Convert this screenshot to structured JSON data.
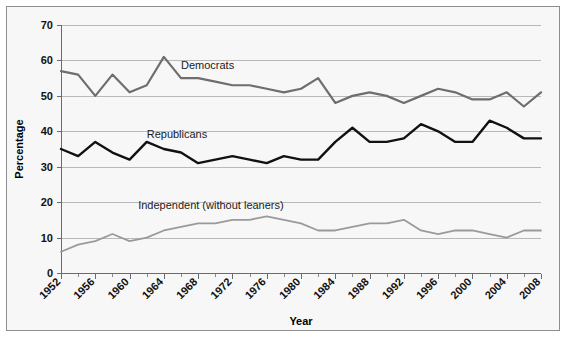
{
  "figure": {
    "background": "#f7f7f7",
    "border_color": "#8d8d8d"
  },
  "chart_data": {
    "type": "line",
    "title": "",
    "xlabel": "Year",
    "ylabel": "Percentage",
    "xlim": [
      1952,
      2008
    ],
    "ylim": [
      0,
      70
    ],
    "yticks": [
      0,
      10,
      20,
      30,
      40,
      50,
      60,
      70
    ],
    "ytick_labels": [
      "0",
      "10",
      "20",
      "30",
      "40",
      "50",
      "60",
      "70"
    ],
    "xticks": [
      1952,
      1956,
      1960,
      1964,
      1968,
      1972,
      1976,
      1980,
      1984,
      1988,
      1992,
      1996,
      2000,
      2004,
      2008
    ],
    "xtick_labels": [
      "1952",
      "1956",
      "1960",
      "1964",
      "1968",
      "1972",
      "1976",
      "1980",
      "1984",
      "1988",
      "1992",
      "1996",
      "2000",
      "2004",
      "2008"
    ],
    "x_minor_step": 2,
    "grid": true,
    "grid_axis": "y",
    "legend": "inline-annotations",
    "x": [
      1952,
      1954,
      1956,
      1958,
      1960,
      1962,
      1964,
      1966,
      1968,
      1970,
      1972,
      1974,
      1976,
      1978,
      1980,
      1982,
      1984,
      1986,
      1988,
      1990,
      1992,
      1994,
      1996,
      1998,
      2000,
      2002,
      2004,
      2006,
      2008
    ],
    "series": [
      {
        "name": "Democrats",
        "color": "#6e6e6e",
        "width": 2.2,
        "label_x": 1966,
        "label_y": 57.5,
        "values": [
          57,
          56,
          50,
          56,
          51,
          53,
          61,
          55,
          55,
          54,
          53,
          53,
          52,
          51,
          52,
          55,
          48,
          50,
          51,
          50,
          48,
          50,
          52,
          51,
          49,
          49,
          51,
          47,
          51
        ]
      },
      {
        "name": "Republicans",
        "color": "#111111",
        "width": 2.4,
        "label_x": 1962,
        "label_y": 38.0,
        "values": [
          35,
          33,
          37,
          34,
          32,
          37,
          35,
          34,
          31,
          32,
          33,
          32,
          31,
          33,
          32,
          32,
          37,
          41,
          37,
          37,
          38,
          42,
          40,
          37,
          37,
          43,
          41,
          38,
          38
        ]
      },
      {
        "name": "Independent (without leaners)",
        "color": "#9a9a9a",
        "width": 1.8,
        "label_x": 1961,
        "label_y": 18.0,
        "values": [
          6,
          8,
          9,
          11,
          9,
          10,
          12,
          13,
          14,
          14,
          15,
          15,
          16,
          15,
          14,
          12,
          12,
          13,
          14,
          14,
          15,
          12,
          11,
          12,
          12,
          11,
          10,
          12,
          12
        ]
      }
    ]
  }
}
